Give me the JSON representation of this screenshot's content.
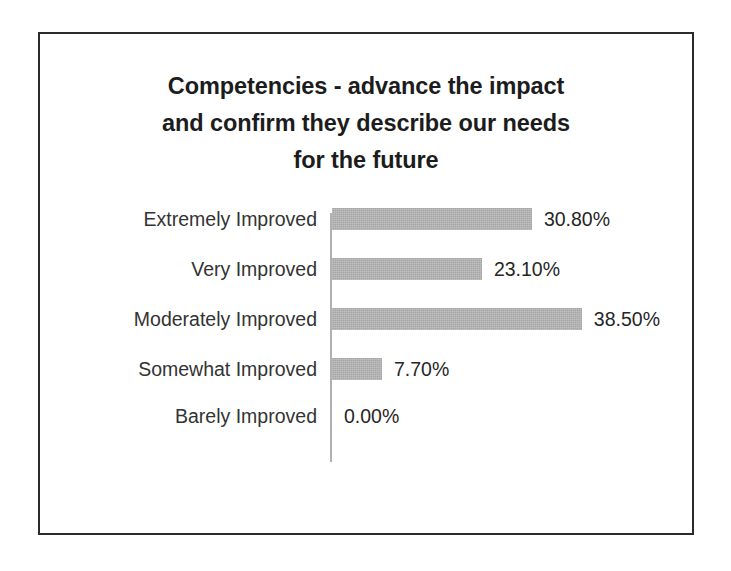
{
  "chart_data": {
    "type": "bar",
    "orientation": "horizontal",
    "title": "Competencies - advance the impact and confirm they describe our needs for the future",
    "title_lines": [
      "Competencies - advance the impact",
      "and confirm they describe our needs",
      "for the future"
    ],
    "categories": [
      "Extremely Improved",
      "Very Improved",
      "Moderately Improved",
      "Somewhat Improved",
      "Barely Improved"
    ],
    "values": [
      30.8,
      23.1,
      38.5,
      7.7,
      0.0
    ],
    "value_labels": [
      "30.80%",
      "23.10%",
      "38.50%",
      "7.70%",
      "0.00%"
    ],
    "xlabel": "",
    "ylabel": "",
    "xlim": [
      0,
      38.5
    ],
    "grid": false,
    "legend": null,
    "bar_color": "#a6a6a6",
    "axis_color": "#b0b0b0",
    "text_color": "#333333",
    "frame_color": "#2b2b2b",
    "background": "#ffffff"
  }
}
